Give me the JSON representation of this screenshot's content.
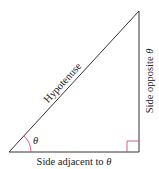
{
  "diagram": {
    "type": "right-triangle",
    "labels": {
      "hypotenuse": "Hypotenuse",
      "opposite": "Side opposite",
      "adjacent": "Side adjacent to",
      "theta": "θ"
    },
    "vertices": {
      "angle_vertex": [
        9,
        152
      ],
      "right_angle_vertex": [
        139,
        152
      ],
      "top_vertex": [
        139,
        11
      ]
    },
    "colors": {
      "line": "#333333",
      "angle_arc": "#d0506a",
      "right_angle_marker": "#d0506a",
      "text": "#222222"
    }
  }
}
